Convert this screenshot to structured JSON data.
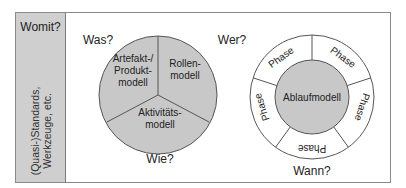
{
  "sidebar": {
    "title": "Womit?",
    "vertical_label_line1": "(Quasi-)Standards,",
    "vertical_label_line2": "Werkzeuge, etc."
  },
  "left_diagram": {
    "question_top_left": "Was?",
    "question_top_right": "Wer?",
    "question_bottom": "Wie?",
    "segments": [
      {
        "line1": "Artefakt-/",
        "line2": "Produkt-",
        "line3": "modell"
      },
      {
        "line1": "Rollen-",
        "line2": "modell"
      },
      {
        "line1": "Aktivitäts-",
        "line2": "modell"
      }
    ]
  },
  "right_diagram": {
    "question_bottom": "Wann?",
    "center_label": "Ablaufmodell",
    "phase_label": "Phase",
    "phase_count": 5
  },
  "colors": {
    "fill_grey": "#c8c8c8",
    "sidebar_grey": "#cfcfcf",
    "stroke": "#555555",
    "frame": "#8a8a8a"
  }
}
